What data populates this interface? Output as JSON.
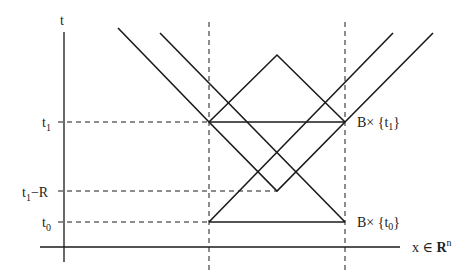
{
  "diagram": {
    "type": "light-cone space-time diagram",
    "axes": {
      "vertical_label": "t",
      "horizontal_label_prefix": "x ∈ ",
      "horizontal_label_set": "R",
      "horizontal_label_sup": "n"
    },
    "ticks": {
      "t1": {
        "base": "t",
        "sub": "1"
      },
      "t1_minus_R": {
        "base": "t",
        "sub": "1",
        "suffix": "−R"
      },
      "t0": {
        "base": "t",
        "sub": "0"
      }
    },
    "annotations": {
      "top_set": {
        "prefix": "B× {t",
        "sub": "1",
        "suffix": "}"
      },
      "bottom_set": {
        "prefix": "B× {t",
        "sub": "0",
        "suffix": "}"
      }
    },
    "colors": {
      "line": "#1a1a1a",
      "background": "#ffffff"
    }
  }
}
